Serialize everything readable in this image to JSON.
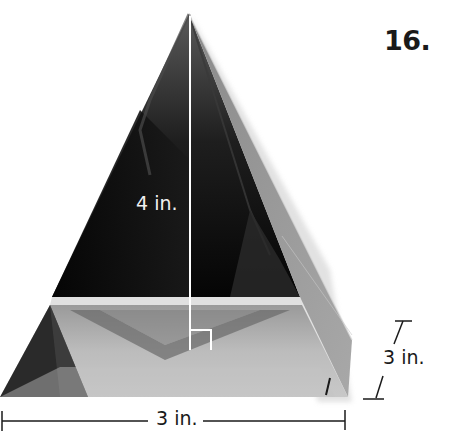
{
  "problem": {
    "number": "16."
  },
  "figure": {
    "dimensions": {
      "height_label": "4 in.",
      "base_depth_label": "3 in.",
      "base_width_label": "3 in."
    },
    "annotations": {
      "height_line": "vertical altitude from apex to base center",
      "right_angle_marker": "right-angle-symbol at base of altitude"
    },
    "colors": {
      "background": "#ffffff",
      "dark_face": "#080808",
      "mid_face": "#6e6e6e",
      "light_face": "#b4b4b4",
      "annotation_line": "#ffffff",
      "dimension_line": "#1a1a1a"
    }
  }
}
